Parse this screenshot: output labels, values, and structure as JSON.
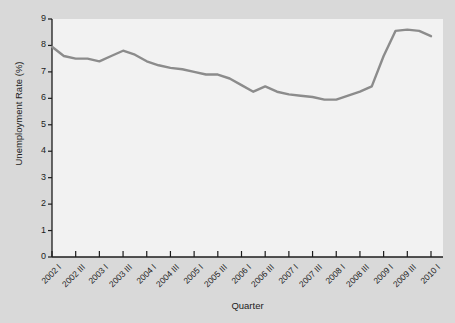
{
  "chart_data": {
    "type": "line",
    "title": "",
    "xlabel": "Quarter",
    "ylabel": "Unemployment Rate (%)",
    "ylim": [
      0,
      9
    ],
    "yticks": [
      0,
      1,
      2,
      3,
      4,
      5,
      6,
      7,
      8,
      9
    ],
    "grid": false,
    "legend": null,
    "line_color": "#8c8c8c",
    "axis_color": "#1c1c1c",
    "plot_bg": "#f2f2f2",
    "figure_bg": "#d9d9d9",
    "xtick_labels": [
      "2002 I",
      "2002 III",
      "2003 I",
      "2003 III",
      "2004 I",
      "2004 III",
      "2005 I",
      "2005 III",
      "2006 I",
      "2006 III",
      "2007 I",
      "2007 III",
      "2008 I",
      "2008 III",
      "2009 I",
      "2009 III",
      "2010 I"
    ],
    "x": [
      "2002 I",
      "2002 II",
      "2002 III",
      "2002 IV",
      "2003 I",
      "2003 II",
      "2003 III",
      "2003 IV",
      "2004 I",
      "2004 II",
      "2004 III",
      "2004 IV",
      "2005 I",
      "2005 II",
      "2005 III",
      "2005 IV",
      "2006 I",
      "2006 II",
      "2006 III",
      "2006 IV",
      "2007 I",
      "2007 II",
      "2007 III",
      "2007 IV",
      "2008 I",
      "2008 II",
      "2008 III",
      "2008 IV",
      "2009 I",
      "2009 II",
      "2009 III",
      "2009 IV",
      "2010 I"
    ],
    "values": [
      7.95,
      7.6,
      7.5,
      7.5,
      7.4,
      7.6,
      7.8,
      7.65,
      7.4,
      7.25,
      7.15,
      7.1,
      7.0,
      6.9,
      6.9,
      6.75,
      6.5,
      6.25,
      6.45,
      6.25,
      6.15,
      6.1,
      6.05,
      5.95,
      5.95,
      6.1,
      6.25,
      6.45,
      7.6,
      8.55,
      8.6,
      8.55,
      8.35
    ],
    "values_note": "Quarterly unemployment rate (%) read from the plotted line"
  }
}
